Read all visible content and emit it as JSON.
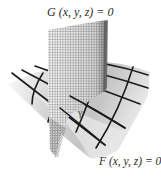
{
  "figure": {
    "type": "two intersecting surfaces",
    "surfaces": [
      {
        "id": "G",
        "label": "G (x, y, z) = 0",
        "orientation": "vertical curved mesh"
      },
      {
        "id": "F",
        "label": "F (x, y, z) = 0",
        "orientation": "horizontal curved grid"
      }
    ],
    "intersection_curve": {
      "label": "γ"
    }
  },
  "colors": {
    "background": "#ffffff",
    "mesh_lines": "#333333",
    "grid_lines": "#1a1a1a",
    "surface_shade_light": "#f2f2f2",
    "surface_shade_dark": "#9a9a9a",
    "text": "#2a2a2a"
  }
}
